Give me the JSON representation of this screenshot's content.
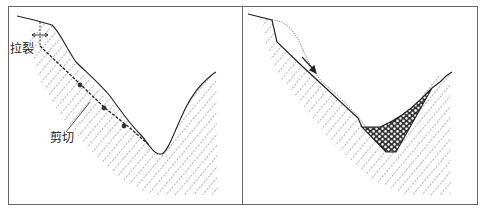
{
  "figure": {
    "panels": [
      {
        "id": "left",
        "description": "Slope before failure with tension crack and shear surface",
        "labels": {
          "tension_crack": "拉裂",
          "shear": "剪切"
        }
      },
      {
        "id": "right",
        "description": "Slope after failure with slid mass deposited at valley bottom",
        "labels": {}
      }
    ],
    "colors": {
      "line": "#222222",
      "hatch": "#555555",
      "frame": "#666666",
      "debris": "#2a2a2a"
    }
  }
}
